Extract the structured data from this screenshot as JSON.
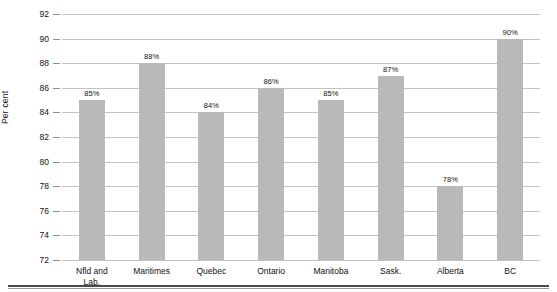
{
  "chart_data": {
    "type": "bar",
    "title": "",
    "subtitle": "",
    "xlabel": "",
    "ylabel": "Per cent",
    "ylim": [
      72,
      92
    ],
    "ytick_step": 2,
    "yticks": [
      72,
      74,
      76,
      78,
      80,
      82,
      84,
      86,
      88,
      90,
      92
    ],
    "ytick_labels": [
      "72",
      "74",
      "76",
      "78",
      "80",
      "82",
      "84",
      "86",
      "88",
      "90",
      "92"
    ],
    "grid": true,
    "grid_axis": "y",
    "legend": false,
    "legend_position": "none",
    "categories": [
      "Nfld and\nLab.",
      "Maritimes",
      "Quebec",
      "Ontario",
      "Manitoba",
      "Sask.",
      "Alberta",
      "BC"
    ],
    "values": [
      85,
      88,
      84,
      86,
      85,
      87,
      78,
      90
    ],
    "data_labels": [
      "85%",
      "88%",
      "84%",
      "86%",
      "85%",
      "87%",
      "78%",
      "90%"
    ],
    "colors": {
      "bar_fill": "#b9b9b9",
      "gridline": "#c3c3c3",
      "tick": "#8d8d8d",
      "text": "#111111",
      "bottom_rule": "#4a4a4a",
      "background": "#ffffff"
    }
  }
}
